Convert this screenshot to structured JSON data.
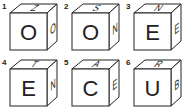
{
  "cubes": [
    {
      "number": "1",
      "front": "O",
      "top": "Z",
      "side": "O"
    },
    {
      "number": "2",
      "front": "O",
      "top": "S",
      "side": "N"
    },
    {
      "number": "3",
      "front": "E",
      "top": "N",
      "side": "E"
    },
    {
      "number": "4",
      "front": "E",
      "top": "T",
      "side": "N"
    },
    {
      "number": "5",
      "front": "C",
      "top": "A",
      "side": "E"
    },
    {
      "number": "6",
      "front": "U",
      "top": "R",
      "side": "B"
    }
  ]
}
